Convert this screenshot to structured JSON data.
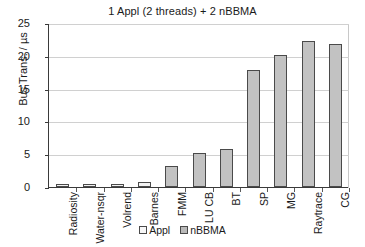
{
  "chart_data": {
    "type": "bar",
    "title": "1 Appl (2 threads) + 2 nBBMA",
    "xlabel": "",
    "ylabel": "Bus Trans. / µs",
    "ylim": [
      0,
      25
    ],
    "yticks": [
      0,
      5,
      10,
      15,
      20,
      25
    ],
    "ytick_labels": [
      "0",
      "5",
      "10",
      "15",
      "20",
      "25"
    ],
    "grid": true,
    "legend_position": "bottom",
    "categories": [
      "Radiosity",
      "Water-nsqr",
      "Volrend",
      "Barnes",
      "FMM",
      "LU CB",
      "BT",
      "SP",
      "MG",
      "Raytrace",
      "CG"
    ],
    "series": [
      {
        "name": "Appl",
        "color": "#f2f2f2",
        "values": [
          0.4,
          0.4,
          0.5,
          0.8,
          0,
          0,
          0,
          0,
          0,
          0,
          0
        ]
      },
      {
        "name": "nBBMA",
        "color": "#c2c2c2",
        "values": [
          0,
          0,
          0,
          0,
          3.2,
          5.2,
          5.8,
          17.8,
          20.2,
          22.3,
          21.8
        ]
      }
    ],
    "values": [
      0.4,
      0.4,
      0.5,
      0.8,
      3.2,
      5.2,
      5.8,
      17.8,
      20.2,
      22.3,
      21.8
    ],
    "legend": [
      {
        "label": "Appl",
        "swatch": "appl"
      },
      {
        "label": "nBBMA",
        "swatch": "nbbma"
      }
    ]
  }
}
